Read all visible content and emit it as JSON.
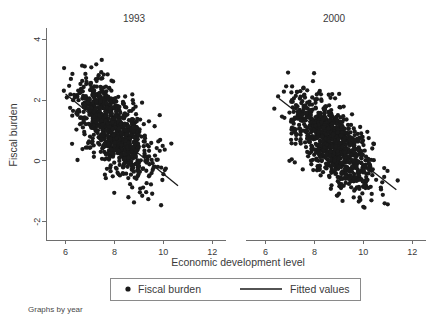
{
  "chart_data": {
    "type": "scatter",
    "title": "",
    "xlabel": "Economic development level",
    "ylabel": "Fiscal burden",
    "note": "Graphs by year",
    "grid": false,
    "legend_position": "bottom-center",
    "xlim": [
      5.2,
      12.4
    ],
    "ylim": [
      -2.6,
      4.3
    ],
    "xticks": [
      6,
      8,
      10,
      12
    ],
    "yticks": [
      4,
      2,
      0,
      -2
    ],
    "xtick_labels": [
      "6",
      "8",
      "10",
      "12"
    ],
    "ytick_labels": [
      "4",
      "2",
      "0",
      "-2"
    ],
    "marker_color": "#1a1a1a",
    "line_color": "#1a1a1a",
    "panels": [
      {
        "title": "1993",
        "n_points": 900,
        "cloud": {
          "x_center": 7.95,
          "x_spread": 0.78,
          "slope": -0.62,
          "intercept": 5.95,
          "residual_spread": 0.62,
          "x_min": 5.9,
          "x_max": 11.1,
          "y_min": -1.85,
          "y_max": 3.35
        },
        "fit": {
          "x_start": 6.0,
          "y_start": 2.2,
          "x_end": 10.6,
          "y_end": -0.82,
          "slope": -0.657,
          "intercept": 6.14
        }
      },
      {
        "title": "2000",
        "n_points": 950,
        "cloud": {
          "x_center": 8.75,
          "x_spread": 0.86,
          "slope": -0.6,
          "intercept": 5.85,
          "residual_spread": 0.6,
          "x_min": 6.3,
          "x_max": 11.6,
          "y_min": -1.6,
          "y_max": 3.1
        },
        "fit": {
          "x_start": 6.55,
          "y_start": 2.05,
          "x_end": 11.35,
          "y_end": -0.95,
          "slope": -0.625,
          "intercept": 6.14
        }
      }
    ],
    "legend": [
      {
        "label": "Fiscal burden",
        "marker": "dot"
      },
      {
        "label": "Fitted values",
        "marker": "line"
      }
    ]
  }
}
